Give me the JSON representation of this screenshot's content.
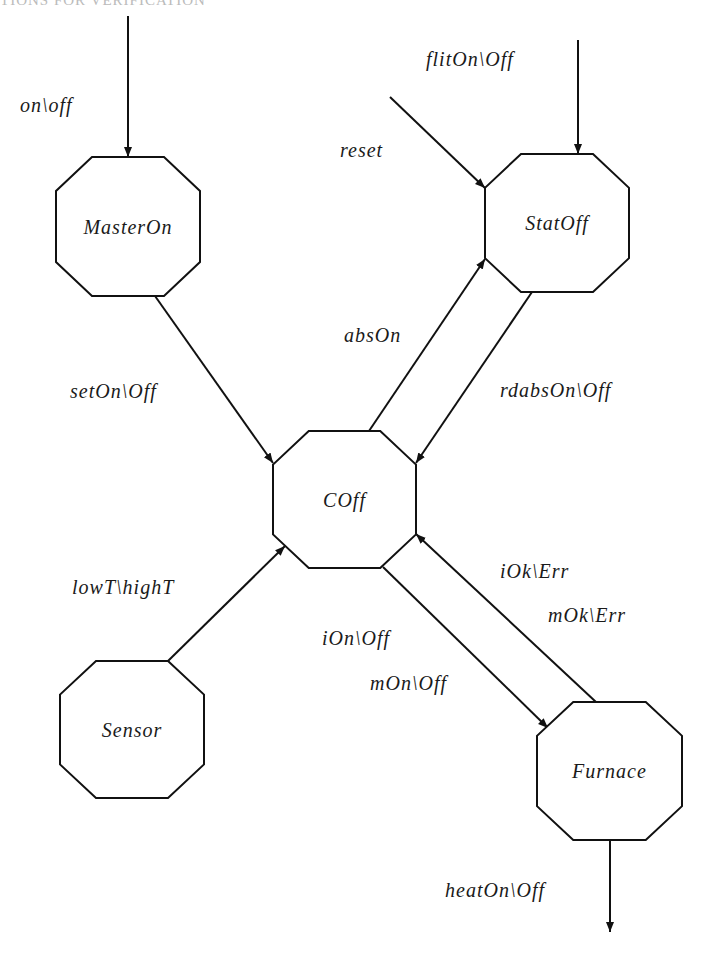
{
  "page": {
    "header_partial": "TIONS FOR VERIFICATION"
  },
  "diagram": {
    "type": "state-machine",
    "nodes": [
      {
        "id": "MasterOn",
        "label": "MasterOn",
        "x": 56,
        "y": 157,
        "w": 144,
        "h": 139
      },
      {
        "id": "StatOff",
        "label": "StatOff",
        "x": 485,
        "y": 154,
        "w": 144,
        "h": 138
      },
      {
        "id": "COff",
        "label": "COff",
        "x": 273,
        "y": 431,
        "w": 143,
        "h": 137
      },
      {
        "id": "Sensor",
        "label": "Sensor",
        "x": 60,
        "y": 661,
        "w": 144,
        "h": 137
      },
      {
        "id": "Furnace",
        "label": "Furnace",
        "x": 537,
        "y": 702,
        "w": 145,
        "h": 138
      }
    ],
    "edges": [
      {
        "id": "on-off",
        "from": "external",
        "to": "MasterOn",
        "label": "on\\off",
        "x1": 128,
        "y1": 16,
        "x2": 128,
        "y2": 157,
        "lx": 20,
        "ly": 112
      },
      {
        "id": "flitOn-Off",
        "from": "external",
        "to": "StatOff",
        "label": "flitOn\\Off",
        "x1": 578,
        "y1": 40,
        "x2": 578,
        "y2": 154,
        "lx": 426,
        "ly": 66
      },
      {
        "id": "reset",
        "from": "external",
        "to": "StatOff",
        "label": "reset",
        "x1": 390,
        "y1": 97,
        "x2": 485,
        "y2": 188,
        "lx": 340,
        "ly": 157
      },
      {
        "id": "setOn-Off",
        "from": "MasterOn",
        "to": "COff",
        "label": "setOn\\Off",
        "x1": 155,
        "y1": 296,
        "x2": 273,
        "y2": 463,
        "lx": 70,
        "ly": 398
      },
      {
        "id": "absOn",
        "from": "COff",
        "to": "StatOff",
        "label": "absOn",
        "x1": 369,
        "y1": 431,
        "x2": 485,
        "y2": 259,
        "lx": 344,
        "ly": 342
      },
      {
        "id": "rdabsOn-Off",
        "from": "StatOff",
        "to": "COff",
        "label": "rdabsOn\\Off",
        "x1": 532,
        "y1": 292,
        "x2": 416,
        "y2": 463,
        "lx": 500,
        "ly": 397
      },
      {
        "id": "lowT-highT",
        "from": "Sensor",
        "to": "COff",
        "label": "lowT\\highT",
        "x1": 168,
        "y1": 661,
        "x2": 285,
        "y2": 546,
        "lx": 72,
        "ly": 594
      },
      {
        "id": "iOn-mOn",
        "from": "COff",
        "to": "Furnace",
        "label": "iOn\\Off",
        "label2": "mOn\\Off",
        "x1": 383,
        "y1": 567,
        "x2": 548,
        "y2": 728,
        "lx": 322,
        "ly": 645,
        "lx2": 370,
        "ly2": 690
      },
      {
        "id": "iOk-mOk",
        "from": "Furnace",
        "to": "COff",
        "label": "iOk\\Err",
        "label2": "mOk\\Err",
        "x1": 596,
        "y1": 702,
        "x2": 416,
        "y2": 534,
        "lx": 500,
        "ly": 578,
        "lx2": 548,
        "ly2": 622
      },
      {
        "id": "heatOn-Off",
        "from": "Furnace",
        "to": "external",
        "label": "heatOn\\Off",
        "x1": 610,
        "y1": 840,
        "x2": 610,
        "y2": 932,
        "lx": 445,
        "ly": 897
      }
    ]
  }
}
